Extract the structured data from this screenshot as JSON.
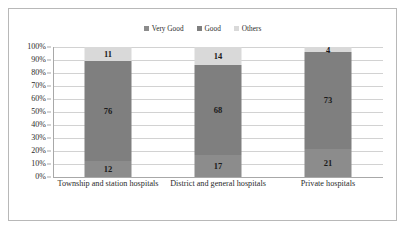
{
  "chart_data": {
    "type": "bar",
    "subtype": "100% stacked column",
    "title": "",
    "subtitle": "",
    "xlabel": "",
    "ylabel": "",
    "ylim": [
      0,
      100
    ],
    "y_tick_labels": [
      "100%",
      "90%",
      "80%",
      "70%",
      "60%",
      "50%",
      "40%",
      "30%",
      "20%",
      "10%",
      "0%"
    ],
    "y_tick_values": [
      100,
      90,
      80,
      70,
      60,
      50,
      40,
      30,
      20,
      10,
      0
    ],
    "grid": true,
    "legend_position": "top-center",
    "categories": [
      "Township and station hospitals",
      "District and general hospitals",
      "Private hospitals"
    ],
    "series": [
      {
        "name": "Very Good",
        "color": "#8c8c8c",
        "values": [
          12,
          76,
          11
        ]
      },
      {
        "name": "Good",
        "color": "#7f7f7f",
        "values": [
          17,
          68,
          14
        ]
      },
      {
        "name": "Others",
        "color": "#d9d9d9",
        "values": [
          21,
          73,
          4
        ]
      }
    ],
    "stacks": [
      {
        "category": "Township and station hospitals",
        "segments": [
          {
            "series": "Very Good",
            "value": 12,
            "label": "12",
            "color": "#8c8c8c"
          },
          {
            "series": "Good",
            "value": 76,
            "label": "76",
            "color": "#7f7f7f"
          },
          {
            "series": "Others",
            "value": 11,
            "label": "11",
            "color": "#d9d9d9"
          }
        ]
      },
      {
        "category": "District and general hospitals",
        "segments": [
          {
            "series": "Very Good",
            "value": 17,
            "label": "17",
            "color": "#8c8c8c"
          },
          {
            "series": "Good",
            "value": 68,
            "label": "68",
            "color": "#7f7f7f"
          },
          {
            "series": "Others",
            "value": 14,
            "label": "14",
            "color": "#d9d9d9"
          }
        ]
      },
      {
        "category": "Private hospitals",
        "segments": [
          {
            "series": "Very Good",
            "value": 21,
            "label": "21",
            "color": "#8c8c8c"
          },
          {
            "series": "Good",
            "value": 73,
            "label": "73",
            "color": "#7f7f7f"
          },
          {
            "series": "Others",
            "value": 4,
            "label": "4",
            "color": "#d9d9d9"
          }
        ]
      }
    ]
  },
  "legend": {
    "entries": [
      {
        "label": "Very Good",
        "color": "#8c8c8c"
      },
      {
        "label": "Good",
        "color": "#7f7f7f"
      },
      {
        "label": "Others",
        "color": "#d9d9d9"
      }
    ]
  },
  "colors": {
    "very_good": "#8c8c8c",
    "good": "#7f7f7f",
    "others": "#d9d9d9",
    "gridline": "#d2d2d2",
    "axis": "#a8a8a8",
    "frame_border": "#b8b8b8",
    "text": "#2b2b2b",
    "label_text": "#1a1a1a",
    "background": "#ffffff"
  }
}
